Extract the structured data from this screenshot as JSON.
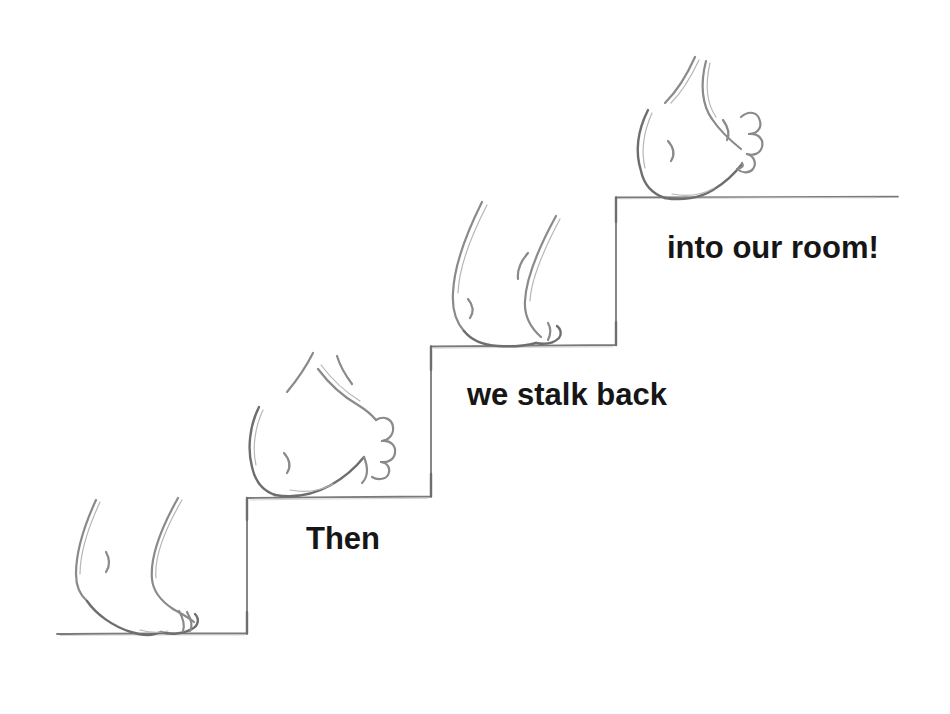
{
  "illustration": {
    "alt": "Pencil sketch of a bare foot tip-toeing up four stair steps",
    "step_count": 4
  },
  "captions": {
    "then": "Then",
    "stalk": "we stalk back",
    "room": "into our room!"
  },
  "colors": {
    "background": "#ffffff",
    "caption_text": "#161616",
    "stair_line": "#7a7a7a",
    "sketch_stroke": "#8a8a8a",
    "sketch_stroke_dark": "#6e6e6e",
    "sketch_stroke_light": "#b6b6b6"
  }
}
